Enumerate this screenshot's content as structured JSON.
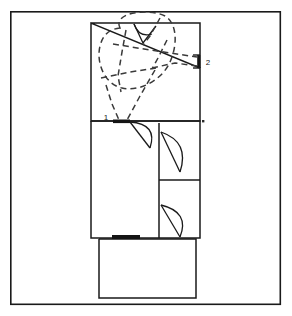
{
  "figure": {
    "type": "architectural-floor-plan",
    "width": 292,
    "height": 316,
    "background_color": "#ffffff",
    "line_color": "#1a1a1a",
    "dashed_color": "#3a3a3a",
    "threshold_fill": "#141414"
  },
  "border": {
    "name": "drawing-frame",
    "x": 10,
    "y": 11,
    "width": 271,
    "height": 294,
    "stroke_width": 1.6
  },
  "markers": [
    {
      "id": "marker-1",
      "label": "1",
      "x": 107,
      "y": 126,
      "description": "doorway marker at upper-room south wall"
    },
    {
      "id": "marker-2",
      "label": "2",
      "x": 207,
      "y": 63,
      "description": "doorway marker at upper-room east wall"
    }
  ],
  "rooms": [
    {
      "id": "upper-room",
      "name": "upper-room",
      "x": 91,
      "y": 23,
      "width": 109,
      "height": 98
    },
    {
      "id": "middle-left-room",
      "name": "middle-left-room",
      "x": 91,
      "y": 123,
      "width": 68,
      "height": 115
    },
    {
      "id": "middle-upper-right-room",
      "name": "middle-upper-right-room",
      "x": 159,
      "y": 123,
      "width": 41,
      "height": 57
    },
    {
      "id": "middle-lower-right-room",
      "name": "middle-lower-right-room",
      "x": 159,
      "y": 180,
      "width": 41,
      "height": 58
    },
    {
      "id": "lower-porch-room",
      "name": "lower-porch-room",
      "x": 99,
      "y": 240,
      "width": 97,
      "height": 58
    }
  ],
  "thresholds": [
    {
      "id": "threshold-door-1",
      "x": 113,
      "y": 121,
      "width": 17,
      "height": 4
    },
    {
      "id": "threshold-south-entry",
      "x": 112,
      "y": 236,
      "width": 28,
      "height": 4
    },
    {
      "id": "threshold-door-2",
      "x": 198,
      "y": 55,
      "width": 4,
      "height": 13
    }
  ],
  "door_swings": [
    {
      "id": "door-swing-top-left",
      "description": "solid swing inside upper room top wall"
    },
    {
      "id": "door-swing-1",
      "description": "swing from marker 1 doorway into middle-left room"
    },
    {
      "id": "door-swing-upper-right",
      "description": "swing into middle upper-right room"
    },
    {
      "id": "door-swing-lower-right",
      "description": "swing into middle lower-right room"
    }
  ],
  "path_overlay": {
    "name": "dashed-movement-path",
    "style": "dashed",
    "dash_pattern": "6 4",
    "stroke_width": 1.5,
    "description": "dashed loop and radiating segments within the upper room converging on doorways 1 and 2"
  },
  "dots": [
    {
      "id": "junction-dot-right",
      "x": 203,
      "y": 121
    }
  ]
}
